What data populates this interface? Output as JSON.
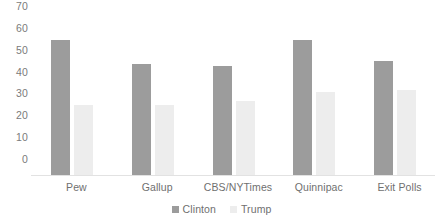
{
  "chart_data": {
    "type": "bar",
    "title": "",
    "xlabel": "",
    "ylabel": "",
    "ylim": [
      0,
      70
    ],
    "y_ticks": [
      0,
      10,
      20,
      30,
      40,
      50,
      60,
      70
    ],
    "grid": false,
    "legend_position": "bottom-center",
    "categories": [
      "Pew",
      "Gallup",
      "CBS/NYTimes",
      "Quinnipac",
      "Exit Polls"
    ],
    "series": [
      {
        "name": "Clinton",
        "color": "#9c9c9c",
        "values": [
          62,
          51,
          50,
          62,
          52
        ]
      },
      {
        "name": "Trump",
        "color": "#ededed",
        "values": [
          32,
          32,
          34,
          38,
          39
        ]
      }
    ]
  },
  "axis": {
    "tick_labels": [
      "70",
      "60",
      "50",
      "40",
      "30",
      "20",
      "10",
      "0"
    ],
    "baseline_color": "#e2e2e2",
    "tick_text_color": "#7b7b7b"
  },
  "legend": {
    "items": [
      {
        "label": "Clinton",
        "color": "#9c9c9c"
      },
      {
        "label": "Trump",
        "color": "#ededed"
      }
    ]
  },
  "canvas": {
    "background": "#ffffff"
  }
}
